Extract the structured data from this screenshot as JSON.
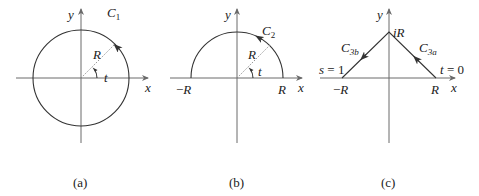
{
  "panels": [
    {
      "id": "a",
      "caption": "(a)",
      "curve_label": "C",
      "curve_sub": "1",
      "radius_label": "R",
      "angle_label": "t",
      "x_axis_label": "x",
      "y_axis_label": "y",
      "shape": "full circle, counterclockwise"
    },
    {
      "id": "b",
      "caption": "(b)",
      "curve_label": "C",
      "curve_sub": "2",
      "radius_label": "R",
      "angle_label": "t",
      "x_axis_label": "x",
      "y_axis_label": "y",
      "left_tick": "−R",
      "right_tick": "R",
      "shape": "upper semicircle, counterclockwise"
    },
    {
      "id": "c",
      "caption": "(c)",
      "apex_label": "iR",
      "segment_a_label": "C",
      "segment_a_sub": "3a",
      "segment_b_label": "C",
      "segment_b_sub": "3b",
      "start_param": "t = 0",
      "end_param": "s = 1",
      "x_axis_label": "x",
      "y_axis_label": "y",
      "left_tick": "−R",
      "right_tick": "R",
      "shape": "triangle path R → iR → −R"
    }
  ]
}
